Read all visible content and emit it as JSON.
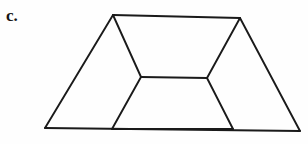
{
  "figure": {
    "label": "c.",
    "caption_text": "c.",
    "background_color": "#fefefe",
    "line_color": "#1a1a1a",
    "line_width": 1.9,
    "shape_type": "trapezoid-with-inner-quadrilateral",
    "canvas": {
      "width": 308,
      "height": 144
    },
    "vertices": {
      "outer": {
        "top_left": {
          "x": 113,
          "y": 15
        },
        "top_right": {
          "x": 240,
          "y": 18
        },
        "bottom_right": {
          "x": 300,
          "y": 131
        },
        "bottom_left": {
          "x": 45,
          "y": 128
        }
      },
      "inner": {
        "top_left": {
          "x": 141,
          "y": 77
        },
        "top_right": {
          "x": 207,
          "y": 78
        },
        "bottom_right": {
          "x": 233,
          "y": 129
        },
        "bottom_left": {
          "x": 112,
          "y": 129
        }
      }
    },
    "edges": [
      {
        "name": "outer-top",
        "from": "outer.top_left",
        "to": "outer.top_right"
      },
      {
        "name": "outer-right",
        "from": "outer.top_right",
        "to": "outer.bottom_right"
      },
      {
        "name": "outer-bottom",
        "from": "outer.bottom_right",
        "to": "outer.bottom_left"
      },
      {
        "name": "outer-left",
        "from": "outer.bottom_left",
        "to": "outer.top_left"
      },
      {
        "name": "inner-top",
        "from": "inner.top_left",
        "to": "inner.top_right"
      },
      {
        "name": "inner-right",
        "from": "inner.top_right",
        "to": "inner.bottom_right"
      },
      {
        "name": "inner-bottom",
        "from": "inner.bottom_right",
        "to": "inner.bottom_left"
      },
      {
        "name": "inner-left",
        "from": "inner.bottom_left",
        "to": "inner.top_left"
      },
      {
        "name": "connector-top-left",
        "from": "outer.top_left",
        "to": "inner.top_left"
      },
      {
        "name": "connector-top-right",
        "from": "outer.top_right",
        "to": "inner.top_right"
      }
    ]
  }
}
